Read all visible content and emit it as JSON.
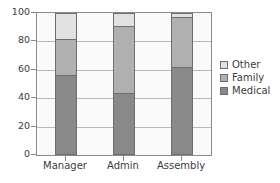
{
  "chart_data": {
    "type": "bar",
    "stacked": true,
    "title": "",
    "subtitle": "",
    "xlabel": "",
    "ylabel": "",
    "categories": [
      "Manager",
      "Admin",
      "Assembly"
    ],
    "series": [
      {
        "name": "Medical",
        "values": [
          56,
          44,
          62
        ],
        "color": "#898989"
      },
      {
        "name": "Family",
        "values": [
          26,
          47,
          35
        ],
        "color": "#b0b0b0"
      },
      {
        "name": "Other",
        "values": [
          18,
          9,
          3
        ],
        "color": "#e2e2e2"
      }
    ],
    "series_order_bottom_to_top": [
      "Medical",
      "Family",
      "Other"
    ],
    "cumulative_tops": {
      "Manager": [
        56,
        82,
        100
      ],
      "Admin": [
        44,
        91,
        100
      ],
      "Assembly": [
        62,
        97,
        100
      ]
    },
    "ylim": [
      0,
      100
    ],
    "yticks": [
      0,
      20,
      40,
      60,
      80,
      100
    ],
    "ytick_labels": [
      "0",
      "20",
      "40",
      "60",
      "80",
      "100"
    ],
    "grid": true,
    "grid_axis": "y",
    "legend": {
      "position": "right",
      "entries": [
        {
          "label": "Other",
          "color": "#e2e2e2"
        },
        {
          "label": "Family",
          "color": "#b0b0b0"
        },
        {
          "label": "Medical",
          "color": "#898989"
        }
      ]
    },
    "colors": {
      "axis": "#8a8a8a",
      "gridline": "#b9b9b9",
      "text": "#3b3b3b",
      "plot_background": "#fafafa",
      "bar_outline": "#6e6e6e"
    }
  }
}
